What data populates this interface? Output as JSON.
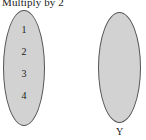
{
  "diagram": {
    "title": "Multiply by 2",
    "domain_set": {
      "label": "",
      "elements": [
        "1",
        "2",
        "3",
        "4"
      ],
      "fill_color": "#d2d2d2",
      "stroke_color": "#555555"
    },
    "codomain_set": {
      "label": "Y",
      "elements": [],
      "fill_color": "#d2d2d2",
      "stroke_color": "#555555"
    }
  },
  "chart_data": {
    "type": "diagram",
    "title": "Multiply by 2",
    "sets": [
      {
        "name": "X",
        "visible_label": "",
        "members": [
          "1",
          "2",
          "3",
          "4"
        ]
      },
      {
        "name": "Y",
        "visible_label": "Y",
        "members": []
      }
    ],
    "mappings": []
  }
}
